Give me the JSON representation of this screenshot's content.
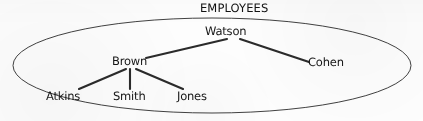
{
  "diagram": {
    "title": "EMPLOYEES",
    "title_position": {
      "x": 200,
      "y": 3
    },
    "container_shape": "ellipse",
    "container": {
      "cx": 212,
      "cy": 65.5,
      "rx": 200,
      "ry": 47.5
    },
    "stroke_color": "#2b2b2b",
    "background_color": "#fdfdfd",
    "nodes": [
      {
        "id": "watson",
        "label": "Watson",
        "x": 205,
        "y": 26,
        "anchor_x": 227,
        "anchor_y": 39
      },
      {
        "id": "brown",
        "label": "Brown",
        "x": 112,
        "y": 56,
        "anchor_x": 130,
        "anchor_y": 69
      },
      {
        "id": "cohen",
        "label": "Cohen",
        "x": 308,
        "y": 57,
        "anchor_x": 308,
        "anchor_y": 62
      },
      {
        "id": "atkins",
        "label": "Atkins",
        "x": 46,
        "y": 91,
        "anchor_x": 78,
        "anchor_y": 89
      },
      {
        "id": "smith",
        "label": "Smith",
        "x": 113,
        "y": 91,
        "anchor_x": 130,
        "anchor_y": 89
      },
      {
        "id": "jones",
        "label": "Jones",
        "x": 177,
        "y": 91,
        "anchor_x": 182,
        "anchor_y": 89
      }
    ],
    "edges": [
      {
        "from": "watson",
        "to": "brown",
        "x1": 227,
        "y1": 39,
        "x2": 146,
        "y2": 58
      },
      {
        "from": "watson",
        "to": "cohen",
        "x1": 240,
        "y1": 39,
        "x2": 309,
        "y2": 62
      },
      {
        "from": "brown",
        "to": "atkins",
        "x1": 126,
        "y1": 69,
        "x2": 79,
        "y2": 89
      },
      {
        "from": "brown",
        "to": "smith",
        "x1": 130,
        "y1": 69,
        "x2": 130,
        "y2": 89
      },
      {
        "from": "brown",
        "to": "jones",
        "x1": 136,
        "y1": 69,
        "x2": 183,
        "y2": 89
      }
    ]
  }
}
